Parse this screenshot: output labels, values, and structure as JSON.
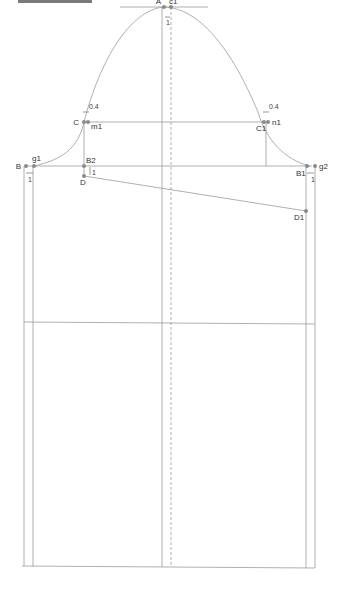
{
  "diagram": {
    "type": "sewing-pattern-draft",
    "line_color": "#8f8f8f",
    "point_color": "#8a8a8a",
    "points": {
      "A": "A",
      "c1": "c1",
      "C": "C",
      "m1": "m1",
      "C1": "C1",
      "n1": "n1",
      "B": "B",
      "g1": "g1",
      "B2": "B2",
      "D": "D",
      "B1": "B1",
      "g2": "g2",
      "D1": "D1"
    },
    "dimensions": {
      "top_offset": "1",
      "left_cap_offset": "0.4",
      "right_cap_offset": "0.4",
      "b2_drop": "1",
      "left_seam": "1",
      "right_seam": "1"
    }
  }
}
